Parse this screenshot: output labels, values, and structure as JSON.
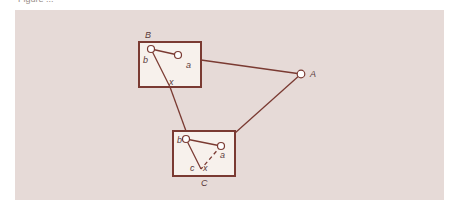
{
  "caption": "Figure  ...  ",
  "colors": {
    "panel_bg": "#e6dad7",
    "line": "#7a3a32",
    "box_border": "#7a3a32",
    "box_fill": "#f7f1ec",
    "node_fill": "#ffffff",
    "label": "#5a3a3a"
  },
  "nodes": {
    "A": {
      "label": "A"
    },
    "B_box": {
      "label": "B",
      "inner": {
        "b": "b",
        "a": "a",
        "x": "x"
      }
    },
    "C_box": {
      "label": "C",
      "inner": {
        "b": "b",
        "a": "a",
        "c": "c",
        "x": "x"
      }
    }
  }
}
